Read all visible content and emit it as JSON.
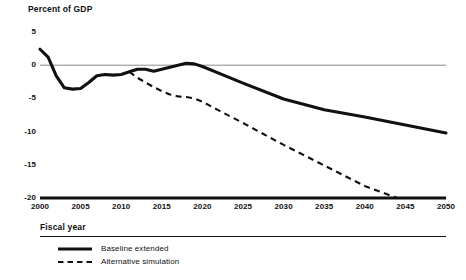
{
  "chart_data": {
    "type": "line",
    "title": "Percent of GDP",
    "xlabel": "Fiscal year",
    "ylabel": "Percent of GDP",
    "xlim": [
      2000,
      2050
    ],
    "ylim": [
      -20,
      5
    ],
    "grid": false,
    "zero_line": true,
    "legend_position": "bottom-left",
    "yticks": [
      "5",
      "0",
      "-5",
      "-10",
      "-15",
      "-20"
    ],
    "ytick_values": [
      5,
      0,
      -5,
      -10,
      -15,
      -20
    ],
    "xticks": [
      "2000",
      "2005",
      "2010",
      "2015",
      "2020",
      "2025",
      "2030",
      "2035",
      "2040",
      "2045",
      "2050"
    ],
    "xtick_values": [
      2000,
      2005,
      2010,
      2015,
      2020,
      2025,
      2030,
      2035,
      2040,
      2045,
      2050
    ],
    "series": [
      {
        "name": "Baseline extended",
        "style": "solid",
        "color": "#111111",
        "x": [
          2000,
          2001,
          2002,
          2003,
          2004,
          2005,
          2006,
          2007,
          2008,
          2009,
          2010,
          2011,
          2012,
          2013,
          2014,
          2015,
          2016,
          2017,
          2018,
          2019,
          2020,
          2022,
          2025,
          2030,
          2035,
          2040,
          2045,
          2050
        ],
        "values": [
          2.4,
          1.2,
          -1.6,
          -3.4,
          -3.6,
          -3.5,
          -2.6,
          -1.6,
          -1.4,
          -1.5,
          -1.4,
          -1.0,
          -0.6,
          -0.6,
          -0.9,
          -0.6,
          -0.3,
          0.0,
          0.3,
          0.2,
          -0.2,
          -1.2,
          -2.7,
          -5.1,
          -6.7,
          -7.8,
          -9.0,
          -10.2
        ]
      },
      {
        "name": "Alternative simulation",
        "style": "dashed",
        "color": "#111111",
        "x": [
          2011,
          2012,
          2013,
          2014,
          2015,
          2016,
          2017,
          2018,
          2019,
          2020,
          2022,
          2025,
          2030,
          2035,
          2040,
          2044
        ],
        "values": [
          -1.0,
          -1.9,
          -2.6,
          -3.3,
          -3.9,
          -4.4,
          -4.7,
          -4.8,
          -5.0,
          -5.5,
          -6.8,
          -8.7,
          -12.0,
          -15.1,
          -18.2,
          -20.0
        ]
      }
    ]
  },
  "legend": {
    "items": [
      {
        "label": "Baseline extended",
        "style": "solid"
      },
      {
        "label": "Alternative simulation",
        "style": "dashed"
      }
    ]
  }
}
